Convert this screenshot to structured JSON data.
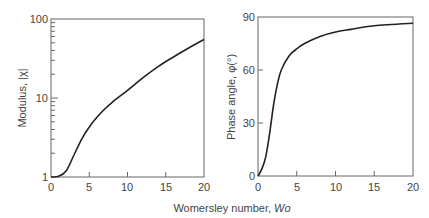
{
  "chart_data": [
    {
      "type": "line",
      "title": "",
      "xlabel": "Womersley number, Wo",
      "ylabel": "Modulus, |χ|",
      "yscale": "log",
      "xlim": [
        0,
        20
      ],
      "ylim": [
        1,
        100
      ],
      "x_ticks": [
        "0",
        "5",
        "10",
        "15",
        "20"
      ],
      "y_ticks": [
        "1",
        "10",
        "100"
      ],
      "grid": false,
      "series": [
        {
          "name": "Modulus",
          "x": [
            0,
            1,
            2,
            3,
            4,
            5,
            6,
            7,
            8,
            10,
            12,
            14,
            16,
            18,
            20
          ],
          "y": [
            1.0,
            1.02,
            1.2,
            1.9,
            3.0,
            4.3,
            5.7,
            7.2,
            8.8,
            12.5,
            18,
            25,
            33,
            43,
            55
          ]
        }
      ]
    },
    {
      "type": "line",
      "title": "",
      "xlabel": "Womersley number, Wo",
      "ylabel": "Phase angle, φ(°)",
      "xlim": [
        0,
        20
      ],
      "ylim": [
        0,
        90
      ],
      "x_ticks": [
        "0",
        "5",
        "10",
        "15",
        "20"
      ],
      "y_ticks": [
        "0",
        "30",
        "60",
        "90"
      ],
      "grid": false,
      "series": [
        {
          "name": "Phase angle",
          "x": [
            0,
            0.5,
            1,
            1.5,
            2,
            2.5,
            3,
            4,
            5,
            6,
            8,
            10,
            12,
            15,
            20
          ],
          "y": [
            0,
            4,
            11,
            24,
            40,
            52,
            60,
            68,
            72,
            75,
            79,
            81.5,
            83,
            85,
            86.5
          ]
        }
      ]
    }
  ],
  "shared_xlabel_prefix": "Womersley number, ",
  "shared_xlabel_var": "Wo",
  "left": {
    "ylabel": "Modulus, |χ|",
    "x_ticks": [
      "0",
      "5",
      "10",
      "15",
      "20"
    ],
    "y_ticks": [
      "1",
      "10",
      "100"
    ]
  },
  "right": {
    "ylabel": "Phase angle, φ(°)",
    "x_ticks": [
      "0",
      "5",
      "10",
      "15",
      "20"
    ],
    "y_ticks": [
      "0",
      "30",
      "60",
      "90"
    ]
  }
}
